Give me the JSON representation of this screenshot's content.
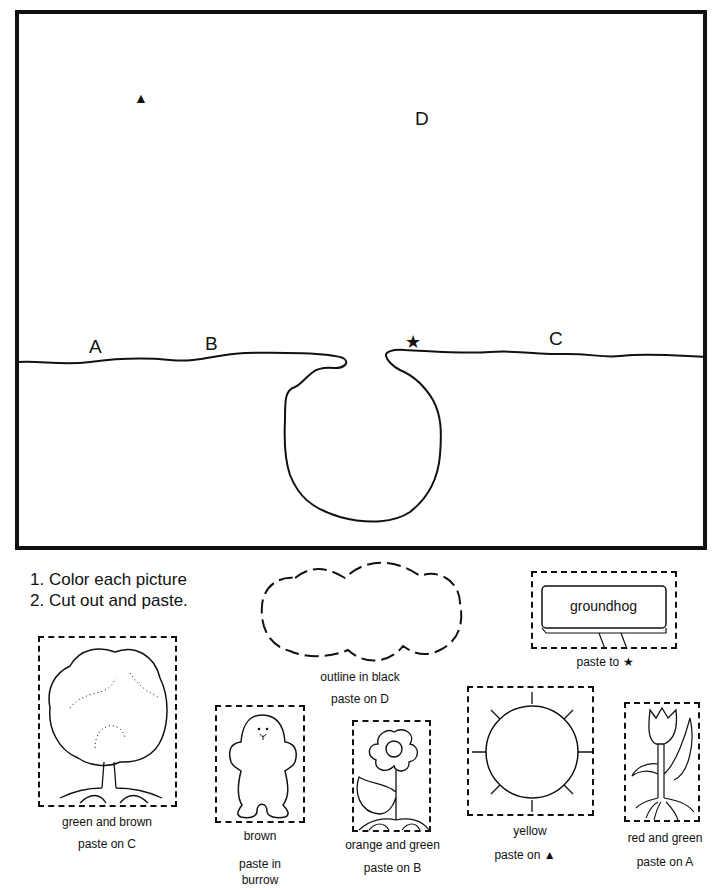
{
  "scene": {
    "labels": {
      "a": "A",
      "b": "B",
      "c": "C",
      "d": "D",
      "star": "★",
      "triangle": "▲"
    }
  },
  "instructions": [
    "1.  Color each picture",
    "2.  Cut out and paste."
  ],
  "cutouts": {
    "cloud": {
      "line1": "outline  in  black",
      "line2": "paste on D"
    },
    "sign": {
      "text": "groundhog",
      "line1": "paste  to ★"
    },
    "tree": {
      "line1": "green  and  brown",
      "line2": "paste  on  C"
    },
    "groundhog": {
      "line1": "brown",
      "line2": "paste  in",
      "line3": "burrow"
    },
    "flower": {
      "line1": "orange  and  green",
      "line2": "paste  on  B"
    },
    "sun": {
      "line1": "yellow",
      "line2": "paste  on  ▲"
    },
    "tulip": {
      "line1": "red  and  green",
      "line2": "paste  on  A"
    }
  }
}
